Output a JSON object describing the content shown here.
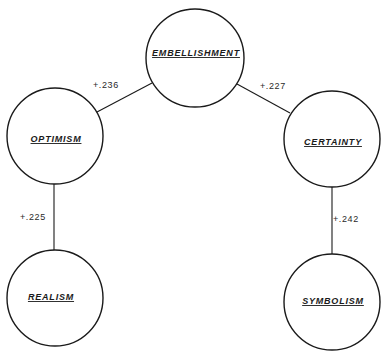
{
  "diagram": {
    "type": "correlation-network",
    "nodes": {
      "embellishment": {
        "label": "EMBELLISHMENT",
        "cx": 195,
        "cy": 58,
        "r": 49
      },
      "optimism": {
        "label": "OPTIMISM",
        "cx": 55,
        "cy": 136,
        "r": 48
      },
      "certainty": {
        "label": "CERTAINTY",
        "cx": 332,
        "cy": 139,
        "r": 48
      },
      "realism": {
        "label": "REALISM",
        "cx": 55,
        "cy": 298,
        "r": 48
      },
      "symbolism": {
        "label": "SYMBOLISM",
        "cx": 332,
        "cy": 302,
        "r": 48
      }
    },
    "edges": {
      "embellishment_optimism": {
        "from": "EMBELLISHMENT",
        "to": "OPTIMISM",
        "value": "+.236"
      },
      "embellishment_certainty": {
        "from": "EMBELLISHMENT",
        "to": "CERTAINTY",
        "value": "+.227"
      },
      "optimism_realism": {
        "from": "OPTIMISM",
        "to": "REALISM",
        "value": "+.225"
      },
      "certainty_symbolism": {
        "from": "CERTAINTY",
        "to": "SYMBOLISM",
        "value": "+.242"
      }
    },
    "colors": {
      "stroke": "#1a1a1a",
      "background": "#ffffff"
    }
  }
}
